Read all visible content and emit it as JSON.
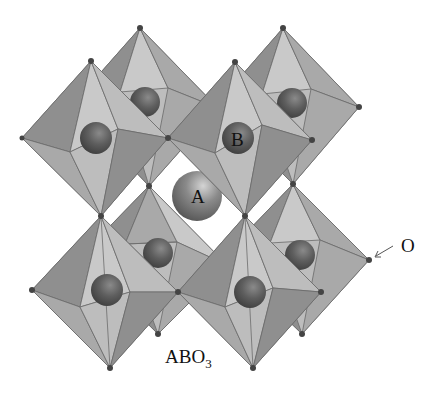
{
  "labels": {
    "a_site": "A",
    "b_site": "B",
    "oxygen": "O",
    "formula_main": "ABO",
    "formula_sub": "3"
  },
  "structure": {
    "name": "perovskite",
    "octahedra_count": 8,
    "a_cation_count": 1,
    "colors": {
      "octahedron_face": "#a9a9a9",
      "b_cation": "#5e5e5e",
      "a_cation": "#8a8a8a",
      "oxygen": "#444444",
      "background": "#ffffff"
    }
  }
}
